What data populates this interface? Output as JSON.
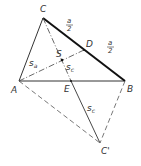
{
  "diagram": {
    "type": "triangle-median-construction",
    "points": {
      "A": {
        "label": "A",
        "x": 19,
        "y": 81
      },
      "B": {
        "label": "B",
        "x": 125,
        "y": 81
      },
      "C": {
        "label": "C",
        "x": 43,
        "y": 18
      },
      "D": {
        "label": "D",
        "x": 84,
        "y": 50
      },
      "E": {
        "label": "E",
        "x": 71,
        "y": 81
      },
      "S": {
        "label": "S",
        "x": 62,
        "y": 60
      },
      "C_prime": {
        "label": "C'",
        "x": 100,
        "y": 143
      }
    },
    "labels": {
      "A": "A",
      "B": "B",
      "C": "C",
      "D": "D",
      "E": "E",
      "S": "S",
      "C_prime": "C'",
      "s_a_main": "s",
      "s_a_sub": "a",
      "s_c_main": "s",
      "s_c_sub": "c",
      "s_c2_main": "s",
      "s_c2_sub": "c",
      "half_a_num": "a",
      "half_a_den": "2",
      "half_a2_num": "a",
      "half_a2_den": "2"
    },
    "colors": {
      "line": "#222222",
      "thin": "#444444"
    }
  }
}
